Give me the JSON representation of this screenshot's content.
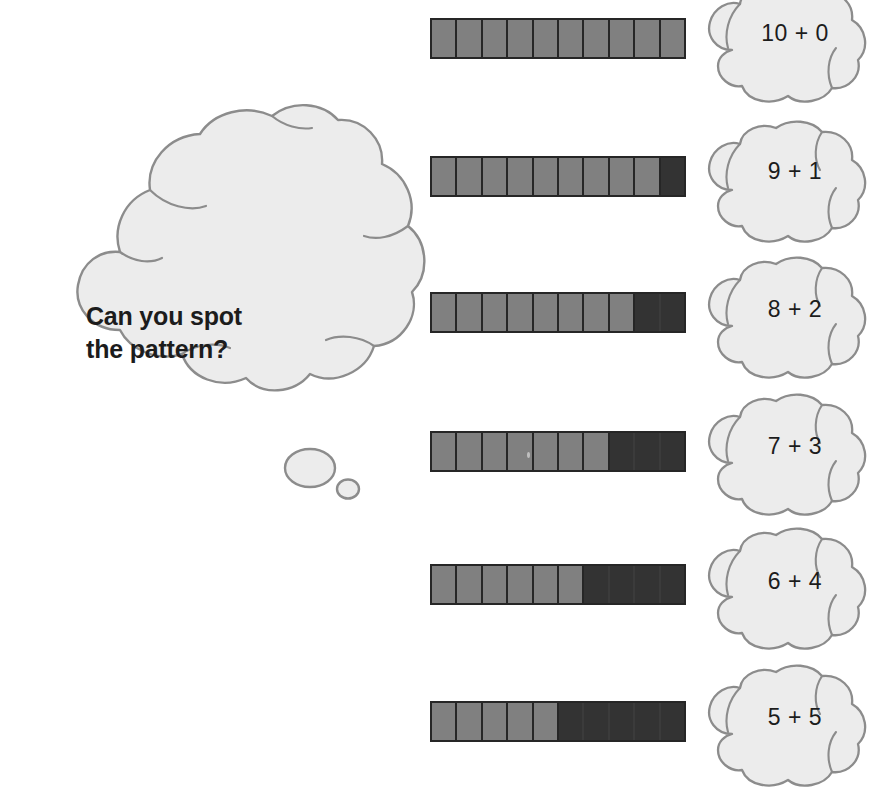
{
  "prompt": {
    "text": "Can you spot\nthe pattern?",
    "bubble_fill": "#ececec",
    "bubble_stroke": "#8c8c8c"
  },
  "colors": {
    "part_whole_light": "#808080",
    "part_whole_dark": "#333333",
    "bar_outline": "#262626",
    "bubble_fill": "#ececec",
    "bubble_stroke": "#8c8c8c",
    "text": "#1c1c1c",
    "background": "#ffffff"
  },
  "chart_data": {
    "type": "bar",
    "xlabel": "",
    "ylabel": "",
    "total": 10,
    "categories": [
      "10 + 0",
      "9 + 1",
      "8 + 2",
      "7 + 3",
      "6 + 4",
      "5 + 5"
    ],
    "series": [
      {
        "name": "light (first addend)",
        "values": [
          10,
          9,
          8,
          7,
          6,
          5
        ]
      },
      {
        "name": "dark (second addend)",
        "values": [
          0,
          1,
          2,
          3,
          4,
          5
        ]
      }
    ]
  },
  "rows": [
    {
      "label": "10 + 0",
      "light": 10,
      "dark": 0
    },
    {
      "label": "9 + 1",
      "light": 9,
      "dark": 1
    },
    {
      "label": "8 + 2",
      "light": 8,
      "dark": 2
    },
    {
      "label": "7 + 3",
      "light": 7,
      "dark": 3
    },
    {
      "label": "6 + 4",
      "light": 6,
      "dark": 4
    },
    {
      "label": "5 + 5",
      "light": 5,
      "dark": 5
    }
  ]
}
